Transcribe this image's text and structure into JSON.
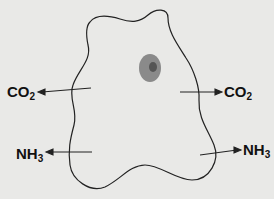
{
  "diagram": {
    "labels": {
      "co2_left": {
        "main": "CO",
        "sub": "2"
      },
      "co2_right": {
        "main": "CO",
        "sub": "2"
      },
      "nh3_left": {
        "main": "NH",
        "sub": "3"
      },
      "nh3_right": {
        "main": "NH",
        "sub": "3"
      }
    },
    "colors": {
      "background": "#e9e9e7",
      "outline": "#222222",
      "nucleus": "#8a8a8a",
      "nucleolus": "#555555"
    }
  }
}
